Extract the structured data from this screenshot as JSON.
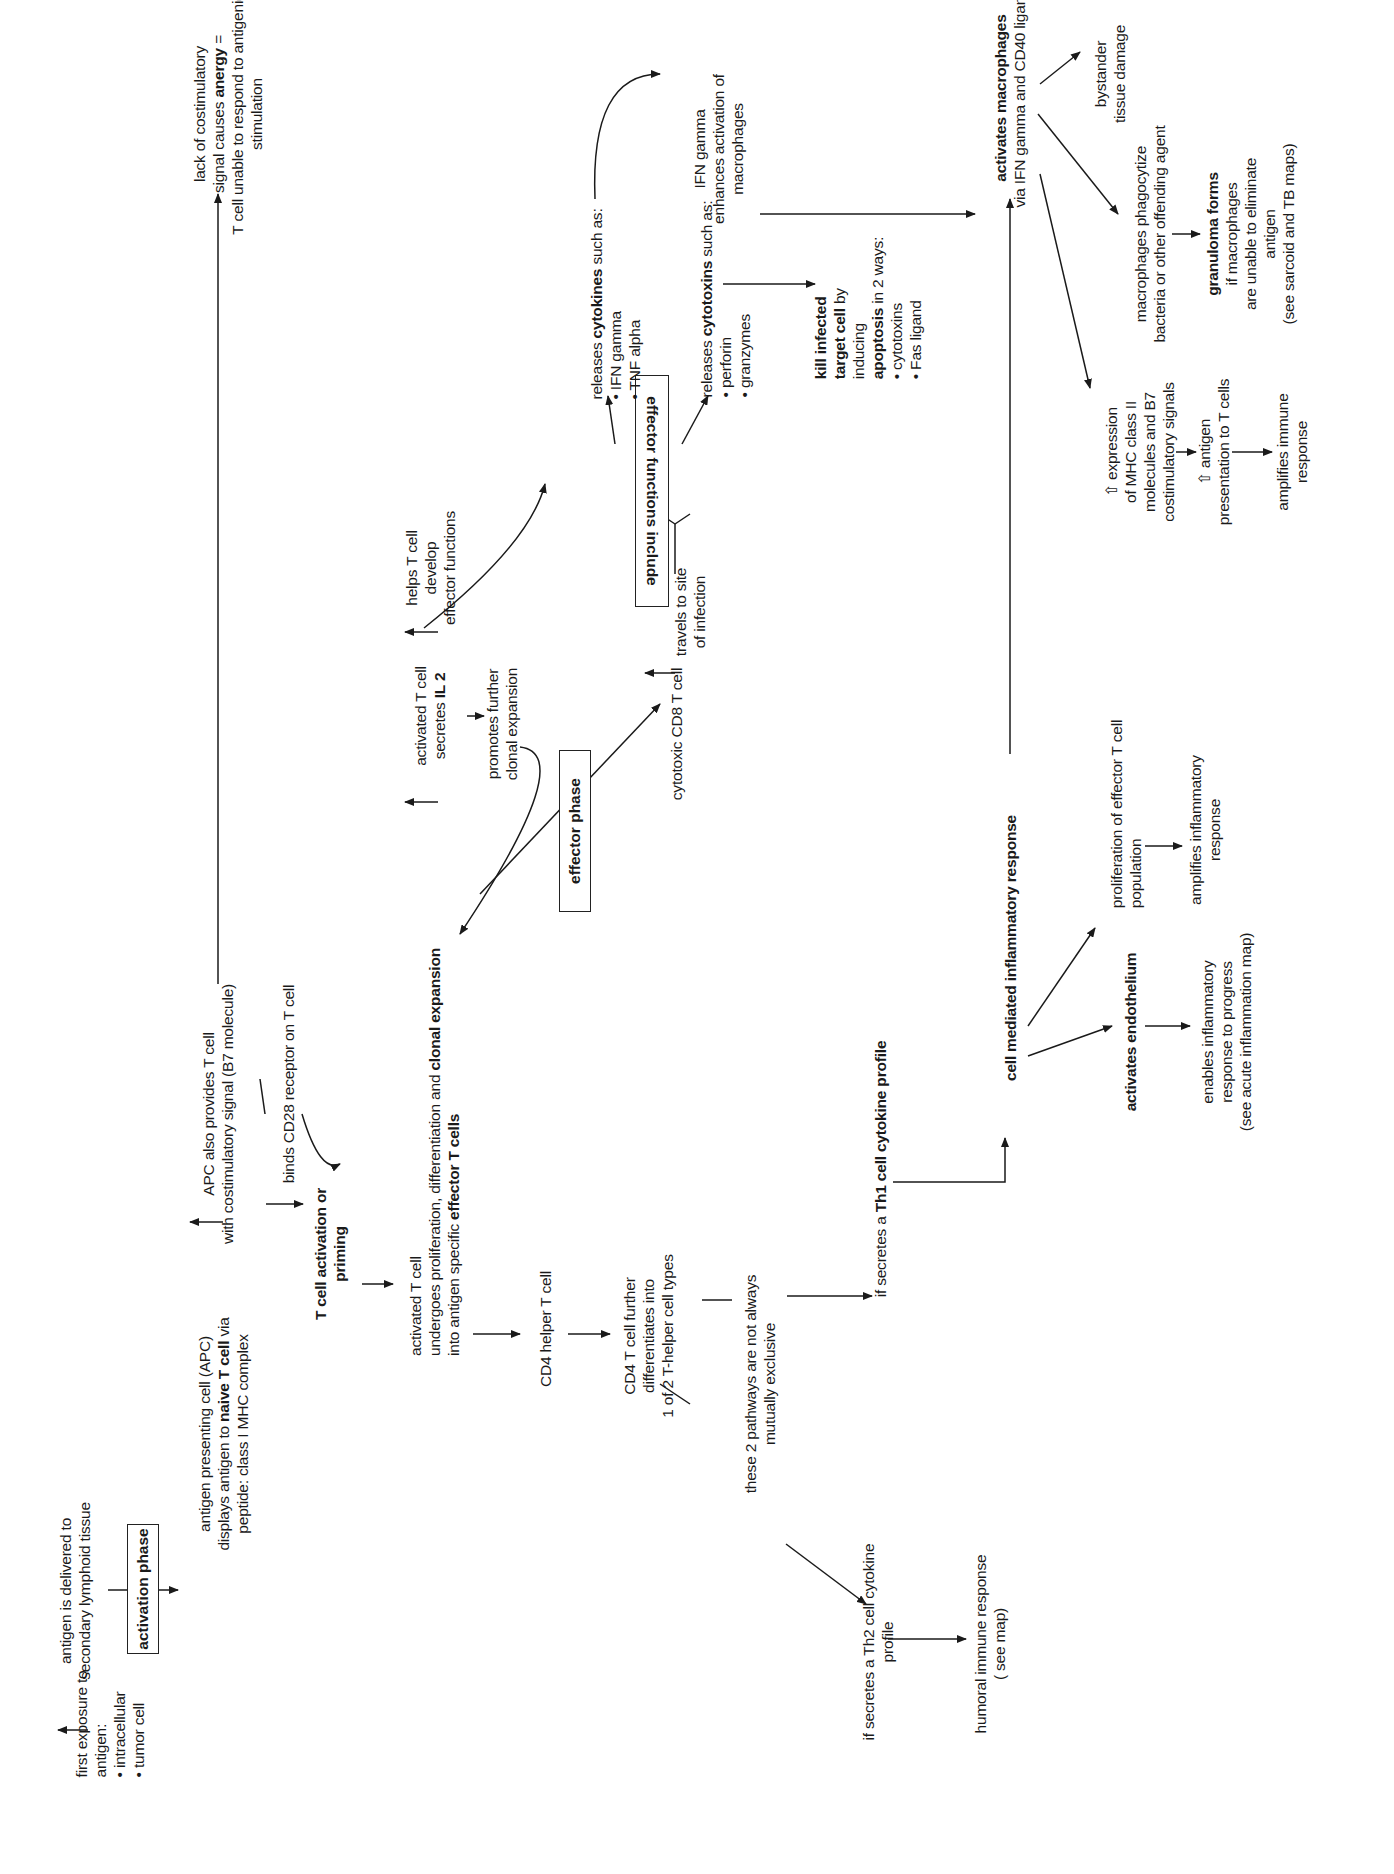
{
  "diagram": {
    "orientation": "page rotated 90° counter-clockwise",
    "phases": {
      "activation": "activation phase",
      "effector": "effector phase",
      "effector_functions": "effector functions include"
    },
    "nodes": {
      "first_exposure": {
        "line1": "first exposure to",
        "line2": "antigen:",
        "bullets": [
          "intracellular",
          "tumor cell"
        ]
      },
      "delivered": {
        "line1": "antigen is delivered to",
        "line2": "secondary lymphoid tissue"
      },
      "apc": {
        "line1": "antigen presenting cell (APC)",
        "line2a": "displays antigen to ",
        "line2b": "naive T cell",
        "line2c": " via",
        "line3": "peptide: class I MHC complex"
      },
      "apc_costim": {
        "line1": "APC also provides T cell",
        "line2": "with costimulatory signal (B7 molecule)"
      },
      "cd28": "binds CD28 receptor on T cell",
      "anergy": {
        "line1": "lack of costimulatory",
        "line2a": "signal causes ",
        "line2b": "anergy",
        "line2c": " =",
        "line3": "T cell unable to respond to antigenic",
        "line4": "stimulation"
      },
      "priming": {
        "line1": "T cell activation or",
        "line2": "priming"
      },
      "activated": {
        "line1": "activated T cell",
        "line2a": "undergoes proliferation, differentiation and ",
        "line2b": "clonal expansion",
        "line3a": "into antigen specific ",
        "line3b": "effector T cells"
      },
      "il2": {
        "line1": "activated T cell",
        "line2a": "secretes ",
        "line2b": "IL 2"
      },
      "helps": {
        "line1": "helps T cell",
        "line2": "develop",
        "line3": "effector functions"
      },
      "promotes": {
        "line1": "promotes further",
        "line2": "clonal expansion"
      },
      "cd8": "cytotoxic CD8 T cell",
      "travels": {
        "line1": "travels to site",
        "line2": "of infection"
      },
      "cytokines": {
        "pre": "releases ",
        "bold": "cytokines",
        "post": " such as:",
        "bullets": [
          "IFN gamma",
          "TNF alpha"
        ]
      },
      "cytotoxins": {
        "pre": "releases ",
        "bold": "cytotoxins",
        "post": " such as:",
        "bullets": [
          "perforin",
          "granzymes"
        ]
      },
      "kill": {
        "line1": "kill infected",
        "line2a": "target cell",
        "line2b": " by",
        "line3": "inducing",
        "line4a": "apoptosis",
        "line4b": " in 2 ways:",
        "bullets": [
          "cytotoxins",
          "Fas ligand"
        ]
      },
      "ifn": {
        "line1": "IFN gamma",
        "line2": "enhances activation of",
        "line3": "macrophages"
      },
      "cd4": "CD4 helper T cell",
      "cd4_further": {
        "line1": "CD4 T cell further",
        "line2": "differentiates into",
        "line3": "1 of 2 T-helper cell types"
      },
      "not_exclusive": {
        "line1": "these 2 pathways are not always",
        "line2": "mutually exclusive"
      },
      "th1": {
        "pre": "if secretes a ",
        "bold": "Th1 cell cytokine profile"
      },
      "th2": {
        "line1": "if secretes a Th2 cell cytokine",
        "line2": "profile"
      },
      "humoral": {
        "line1": "humoral immune response",
        "line2": "( see map)"
      },
      "cmir": "cell mediated inflammatory response",
      "endothelium": "activates endothelium",
      "enables": {
        "line1": "enables inflammatory",
        "line2": "response to progress",
        "line3": "(see acute inflammation map)"
      },
      "prolif": {
        "line1": "proliferation of effector T cell",
        "line2": "population"
      },
      "amplifies_inflam": {
        "line1": "amplifies inflammatory",
        "line2": "response"
      },
      "macrophages": {
        "bold": "activates macrophages",
        "line2": "via IFN gamma and CD40 ligand"
      },
      "bystander": {
        "line1": "bystander",
        "line2": "tissue damage"
      },
      "phagocytize": {
        "line1": "macrophages phagocytize",
        "line2": "bacteria or other offending agent"
      },
      "granuloma": {
        "bold": "granuloma forms",
        "line2": "if macrophages",
        "line3": "are unable to eliminate",
        "line4": "antigen",
        "line5": "(see sarcoid and TB maps)"
      },
      "mhc": {
        "line1": "⇧ expression",
        "line2": "of MHC class II",
        "line3": "molecules and B7",
        "line4": "costimulatory signals"
      },
      "presentation": {
        "line1": "⇧ antigen",
        "line2": "presentation to T cells"
      },
      "amplifies_immune": {
        "line1": "amplifies immune",
        "line2": "response"
      }
    },
    "colors": {
      "ink": "#1a1a1a",
      "background": "#ffffff"
    }
  }
}
